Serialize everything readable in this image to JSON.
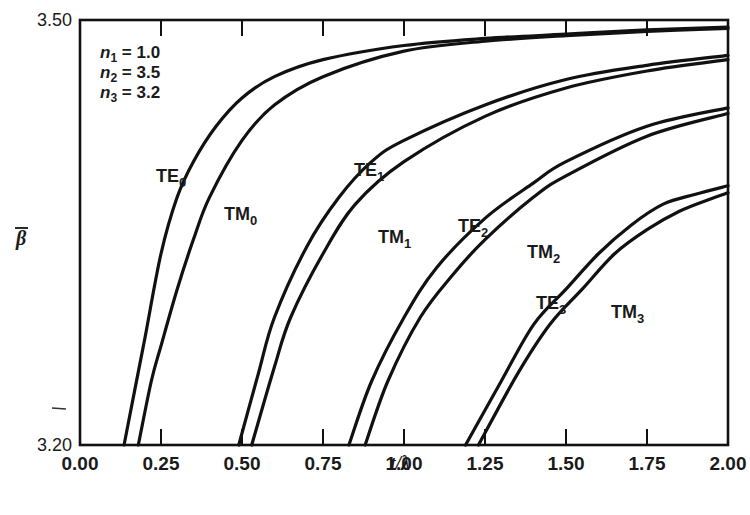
{
  "chart_data": {
    "type": "line",
    "title": "",
    "xlabel": "t/λ",
    "ylabel": "β̄",
    "xlim": [
      0.0,
      2.0
    ],
    "ylim": [
      3.2,
      3.5
    ],
    "x_ticks": [
      "0.00",
      "0.25",
      "0.50",
      "0.75",
      "1.00",
      "1.25",
      "1.50",
      "1.75",
      "2.00"
    ],
    "y_ticks": [
      "3.20",
      "3.50"
    ],
    "grid": false,
    "legend": "inline labels",
    "annotations": [
      {
        "text": "n1 = 1.0",
        "base": "n",
        "sub": "1",
        "rest": " = 1.0"
      },
      {
        "text": "n2 = 3.5",
        "base": "n",
        "sub": "2",
        "rest": " = 3.5"
      },
      {
        "text": "n3 = 3.2",
        "base": "n",
        "sub": "3",
        "rest": " = 3.2"
      }
    ],
    "series": [
      {
        "name": "TE0",
        "base": "TE",
        "sub": "0",
        "label_pos": [
          156,
          182
        ],
        "x": [
          0.136,
          0.17,
          0.2,
          0.25,
          0.3,
          0.35,
          0.42,
          0.5,
          0.6,
          0.75,
          1.0,
          1.25,
          1.5,
          1.75,
          2.0
        ],
        "y": [
          3.2,
          3.24,
          3.275,
          3.335,
          3.375,
          3.4,
          3.425,
          3.445,
          3.46,
          3.472,
          3.482,
          3.487,
          3.49,
          3.493,
          3.495
        ]
      },
      {
        "name": "TM0",
        "base": "TM",
        "sub": "0",
        "label_pos": [
          224,
          220
        ],
        "x": [
          0.18,
          0.22,
          0.25,
          0.3,
          0.35,
          0.4,
          0.5,
          0.6,
          0.75,
          1.0,
          1.25,
          1.5,
          1.75,
          2.0
        ],
        "y": [
          3.2,
          3.245,
          3.27,
          3.31,
          3.345,
          3.375,
          3.415,
          3.44,
          3.46,
          3.478,
          3.485,
          3.489,
          3.492,
          3.494
        ]
      },
      {
        "name": "TE1",
        "base": "TE",
        "sub": "1",
        "label_pos": [
          354,
          176
        ],
        "x": [
          0.49,
          0.55,
          0.6,
          0.7,
          0.8,
          0.9,
          1.0,
          1.25,
          1.5,
          1.75,
          2.0
        ],
        "y": [
          3.2,
          3.25,
          3.29,
          3.34,
          3.375,
          3.4,
          3.415,
          3.44,
          3.458,
          3.468,
          3.475
        ]
      },
      {
        "name": "TM1",
        "base": "TM",
        "sub": "1",
        "label_pos": [
          378,
          243
        ],
        "x": [
          0.53,
          0.6,
          0.65,
          0.75,
          0.85,
          1.0,
          1.25,
          1.5,
          1.75,
          2.0
        ],
        "y": [
          3.2,
          3.255,
          3.29,
          3.335,
          3.37,
          3.4,
          3.432,
          3.452,
          3.464,
          3.472
        ]
      },
      {
        "name": "TE2",
        "base": "TE",
        "sub": "2",
        "label_pos": [
          458,
          232
        ],
        "x": [
          0.83,
          0.9,
          1.0,
          1.1,
          1.25,
          1.4,
          1.5,
          1.75,
          2.0
        ],
        "y": [
          3.2,
          3.245,
          3.29,
          3.325,
          3.36,
          3.385,
          3.4,
          3.425,
          3.438
        ]
      },
      {
        "name": "TM2",
        "base": "TM",
        "sub": "2",
        "label_pos": [
          527,
          258
        ],
        "x": [
          0.88,
          0.95,
          1.05,
          1.15,
          1.25,
          1.4,
          1.5,
          1.75,
          2.0
        ],
        "y": [
          3.2,
          3.245,
          3.29,
          3.32,
          3.345,
          3.375,
          3.39,
          3.418,
          3.434
        ]
      },
      {
        "name": "TE3",
        "base": "TE",
        "sub": "3",
        "label_pos": [
          536,
          309
        ],
        "x": [
          1.19,
          1.3,
          1.4,
          1.5,
          1.6,
          1.7,
          1.8,
          1.9,
          2.0
        ],
        "y": [
          3.2,
          3.245,
          3.285,
          3.31,
          3.335,
          3.355,
          3.37,
          3.377,
          3.383
        ]
      },
      {
        "name": "TM3",
        "base": "TM",
        "sub": "3",
        "label_pos": [
          611,
          318
        ],
        "x": [
          1.23,
          1.35,
          1.45,
          1.55,
          1.65,
          1.75,
          1.85,
          1.95,
          2.0
        ],
        "y": [
          3.2,
          3.25,
          3.285,
          3.31,
          3.335,
          3.352,
          3.365,
          3.374,
          3.378
        ]
      }
    ]
  },
  "style": {
    "ink_color": "#111111",
    "background": "#ffffff"
  }
}
